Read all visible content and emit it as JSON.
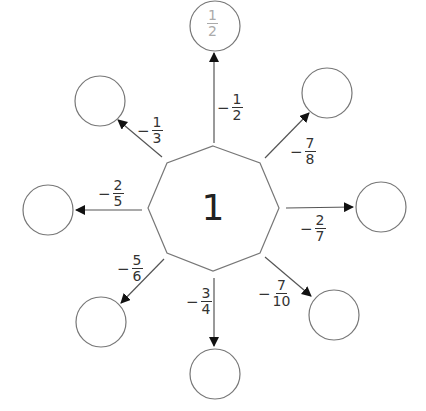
{
  "center": {
    "value": "1"
  },
  "branches": [
    {
      "id": "top",
      "op_sign": "−",
      "op_num": "1",
      "op_den": "2",
      "result_num": "1",
      "result_den": "2",
      "result_filled": true
    },
    {
      "id": "upper-right",
      "op_sign": "−",
      "op_num": "7",
      "op_den": "8",
      "result_filled": false
    },
    {
      "id": "right",
      "op_sign": "−",
      "op_num": "2",
      "op_den": "7",
      "result_filled": false
    },
    {
      "id": "lower-right",
      "op_sign": "−",
      "op_num": "7",
      "op_den": "10",
      "result_filled": false
    },
    {
      "id": "bottom",
      "op_sign": "−",
      "op_num": "3",
      "op_den": "4",
      "result_filled": false
    },
    {
      "id": "lower-left",
      "op_sign": "−",
      "op_num": "5",
      "op_den": "6",
      "result_filled": false
    },
    {
      "id": "left",
      "op_sign": "−",
      "op_num": "2",
      "op_den": "5",
      "result_filled": false
    },
    {
      "id": "upper-left",
      "op_sign": "−",
      "op_num": "1",
      "op_den": "3",
      "result_filled": false
    }
  ],
  "colors": {
    "stroke": "#666666",
    "example_text": "#aaaaaa",
    "text": "#333333"
  }
}
